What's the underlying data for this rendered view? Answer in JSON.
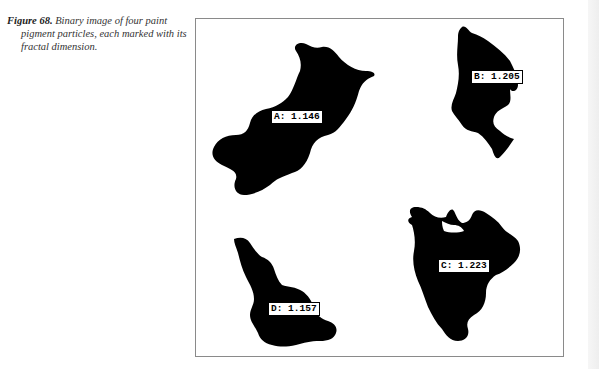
{
  "caption": {
    "figure_label": "Figure 68.",
    "text": "Binary image of four paint pigment particles, each marked with its fractal dimension."
  },
  "figure": {
    "particles": [
      {
        "id": "A",
        "label": "A: 1.146",
        "fractal_dimension": 1.146
      },
      {
        "id": "B",
        "label": "B: 1.205",
        "fractal_dimension": 1.205
      },
      {
        "id": "C",
        "label": "C: 1.223",
        "fractal_dimension": 1.223
      },
      {
        "id": "D",
        "label": "D: 1.157",
        "fractal_dimension": 1.157
      }
    ]
  }
}
